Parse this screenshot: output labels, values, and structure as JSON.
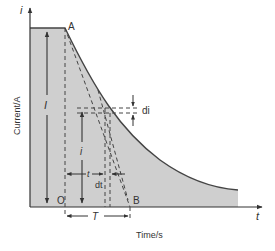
{
  "diagram": {
    "type": "capacitor-discharge-current-curve",
    "colors": {
      "fill": "#cfcfcf",
      "line": "#444444",
      "background": "#ffffff"
    },
    "axes": {
      "y_axis_symbol": "i",
      "x_axis_symbol": "t",
      "y_label": "Current/A",
      "x_label": "Time/s"
    },
    "points": {
      "start": "A",
      "intercept": "B",
      "origin": "O"
    },
    "annotations": {
      "initial_current": "I",
      "current_at_t": "i",
      "time_t": "t",
      "small_time": "dt",
      "small_current": "di",
      "time_constant": "T"
    }
  }
}
